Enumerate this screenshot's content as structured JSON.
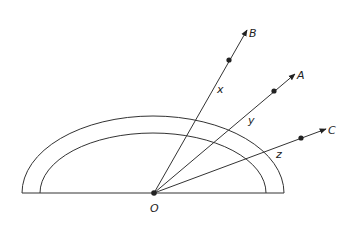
{
  "diagram": {
    "type": "geometry-protractor-rays",
    "origin": {
      "label": "O",
      "x": 154,
      "y": 193
    },
    "baseline": {
      "x1": 22,
      "x2": 284,
      "y": 193
    },
    "arcs": [
      {
        "name": "outer",
        "cx": 153,
        "cy": 193,
        "rx": 131,
        "ry": 77
      },
      {
        "name": "inner",
        "cx": 153,
        "cy": 193,
        "rx": 113,
        "ry": 60
      }
    ],
    "rays": [
      {
        "label": "B",
        "tip": {
          "x": 247,
          "y": 30
        },
        "dot": {
          "x": 229,
          "y": 60
        },
        "label_pos": {
          "x": 249,
          "y": 37
        },
        "angle_label": "x",
        "angle_label_pos": {
          "x": 217,
          "y": 93
        }
      },
      {
        "label": "A",
        "tip": {
          "x": 295,
          "y": 74
        },
        "dot": {
          "x": 274,
          "y": 91
        },
        "label_pos": {
          "x": 297,
          "y": 79
        },
        "angle_label": "y",
        "angle_label_pos": {
          "x": 248,
          "y": 124
        }
      },
      {
        "label": "C",
        "tip": {
          "x": 326,
          "y": 129
        },
        "dot": {
          "x": 301,
          "y": 138
        },
        "label_pos": {
          "x": 328,
          "y": 134
        },
        "angle_label": "z",
        "angle_label_pos": {
          "x": 276,
          "y": 158
        }
      }
    ]
  }
}
